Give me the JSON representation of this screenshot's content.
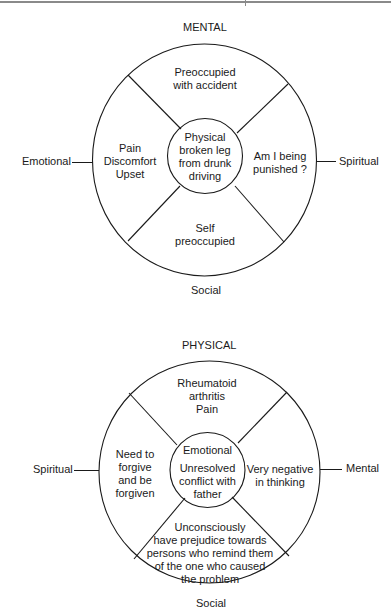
{
  "diagram1": {
    "top_label": "MENTAL",
    "left_label": "Emotional",
    "right_label": "Spiritual",
    "bottom_label": "Social",
    "center": "Physical\nbroken leg\nfrom drunk\ndriving",
    "sectors": {
      "top": "Preoccupied\nwith accident",
      "left": "Pain\nDiscomfort\nUpset",
      "right": "Am I being\npunished ?",
      "bottom": "Self\npreoccupied"
    }
  },
  "diagram2": {
    "top_label": "PHYSICAL",
    "left_label": "Spiritual",
    "right_label": "Mental",
    "bottom_label": "Social",
    "center_title": "Emotional",
    "center": "Unresolved\nconflict with\nfather",
    "sectors": {
      "top": "Rheumatoid\narthritis\nPain",
      "left": "Need to\nforgive\nand be\nforgiven",
      "right": "Very  negative\nin thinking",
      "bottom": "Unconsciously\nhave prejudice towards\npersons who remind them\nof the one who caused\nthe problem"
    }
  }
}
